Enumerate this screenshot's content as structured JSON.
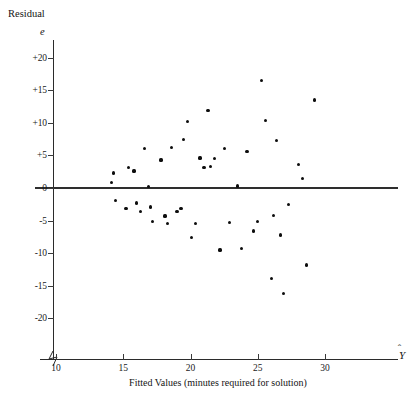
{
  "chart_data": {
    "type": "scatter",
    "title": "",
    "ylabel_top": "Residual",
    "ysymbol": "e",
    "xlabel": "Fitted Values (minutes required for solution)",
    "xsymbol": "Y",
    "xticks": [
      10,
      15,
      20,
      25,
      30
    ],
    "xtick_labels": [
      "10",
      "15",
      "20",
      "25",
      "30"
    ],
    "yticks": [
      20,
      15,
      10,
      5,
      0,
      -5,
      -10,
      -15,
      -20
    ],
    "ytick_labels": [
      "+20",
      "+15",
      "+10",
      "+5",
      "0",
      "-5",
      "-10",
      "-15",
      "-20"
    ],
    "xlim": [
      8.7,
      33.5
    ],
    "ylim": [
      -24,
      23
    ],
    "grid": false,
    "legend": null,
    "reference_line": {
      "y": 0,
      "color": "#2e2e2e"
    },
    "axis_break": true,
    "marker_color": "#0d0d0d",
    "points": [
      {
        "x": 14.1,
        "y": 0.9
      },
      {
        "x": 14.3,
        "y": 2.3
      },
      {
        "x": 14.4,
        "y": -1.9
      },
      {
        "x": 15.2,
        "y": -3.2
      },
      {
        "x": 15.4,
        "y": 3.2
      },
      {
        "x": 15.8,
        "y": 2.6
      },
      {
        "x": 16.0,
        "y": -2.3
      },
      {
        "x": 16.3,
        "y": -3.6
      },
      {
        "x": 16.6,
        "y": 6.0
      },
      {
        "x": 16.9,
        "y": 0.2
      },
      {
        "x": 17.0,
        "y": -2.9
      },
      {
        "x": 17.2,
        "y": -5.2
      },
      {
        "x": 17.8,
        "y": 4.3
      },
      {
        "x": 18.1,
        "y": -4.3
      },
      {
        "x": 18.3,
        "y": -5.5
      },
      {
        "x": 18.6,
        "y": 6.2
      },
      {
        "x": 19.0,
        "y": -3.6
      },
      {
        "x": 19.3,
        "y": -3.1
      },
      {
        "x": 19.5,
        "y": 7.4
      },
      {
        "x": 19.8,
        "y": 10.2
      },
      {
        "x": 20.1,
        "y": -7.6
      },
      {
        "x": 20.4,
        "y": -5.4
      },
      {
        "x": 20.7,
        "y": 4.6
      },
      {
        "x": 21.0,
        "y": 3.2
      },
      {
        "x": 21.3,
        "y": 11.9
      },
      {
        "x": 21.5,
        "y": 3.3
      },
      {
        "x": 21.8,
        "y": 4.5
      },
      {
        "x": 22.2,
        "y": -9.5
      },
      {
        "x": 22.5,
        "y": 6.1
      },
      {
        "x": 22.9,
        "y": -5.3
      },
      {
        "x": 23.5,
        "y": 0.3
      },
      {
        "x": 23.8,
        "y": -9.3
      },
      {
        "x": 24.2,
        "y": 5.6
      },
      {
        "x": 24.7,
        "y": -6.6
      },
      {
        "x": 25.0,
        "y": -5.1
      },
      {
        "x": 25.3,
        "y": 16.5
      },
      {
        "x": 25.6,
        "y": 10.4
      },
      {
        "x": 26.0,
        "y": -13.9
      },
      {
        "x": 26.2,
        "y": -4.2
      },
      {
        "x": 26.4,
        "y": 7.3
      },
      {
        "x": 26.7,
        "y": -7.2
      },
      {
        "x": 26.9,
        "y": -16.2
      },
      {
        "x": 27.3,
        "y": -2.5
      },
      {
        "x": 28.0,
        "y": 3.6
      },
      {
        "x": 28.3,
        "y": 1.5
      },
      {
        "x": 28.6,
        "y": -11.8
      },
      {
        "x": 29.2,
        "y": 13.5
      }
    ]
  }
}
